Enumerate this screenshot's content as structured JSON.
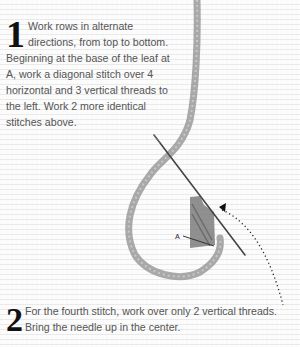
{
  "steps": [
    {
      "number": "1",
      "text": "Work rows in alternate directions, from top to bottom. Beginning at the base of the leaf at A, work a diagonal stitch over 4 horizontal and 3 vertical threads to the left. Work 2 more identical stitches above."
    },
    {
      "number": "2",
      "text": "For the fourth stitch, work over only 2 vertical threads. Bring the needle up in the center."
    }
  ],
  "illustration": {
    "label_a": "A",
    "elements": [
      "yarn-strand",
      "needle",
      "stitch-block",
      "dotted-arrow"
    ],
    "colors": {
      "yarn": "#8a8a8a",
      "stitches": "#7a7a7a",
      "needle": "#444444",
      "arrow": "#222222"
    }
  }
}
